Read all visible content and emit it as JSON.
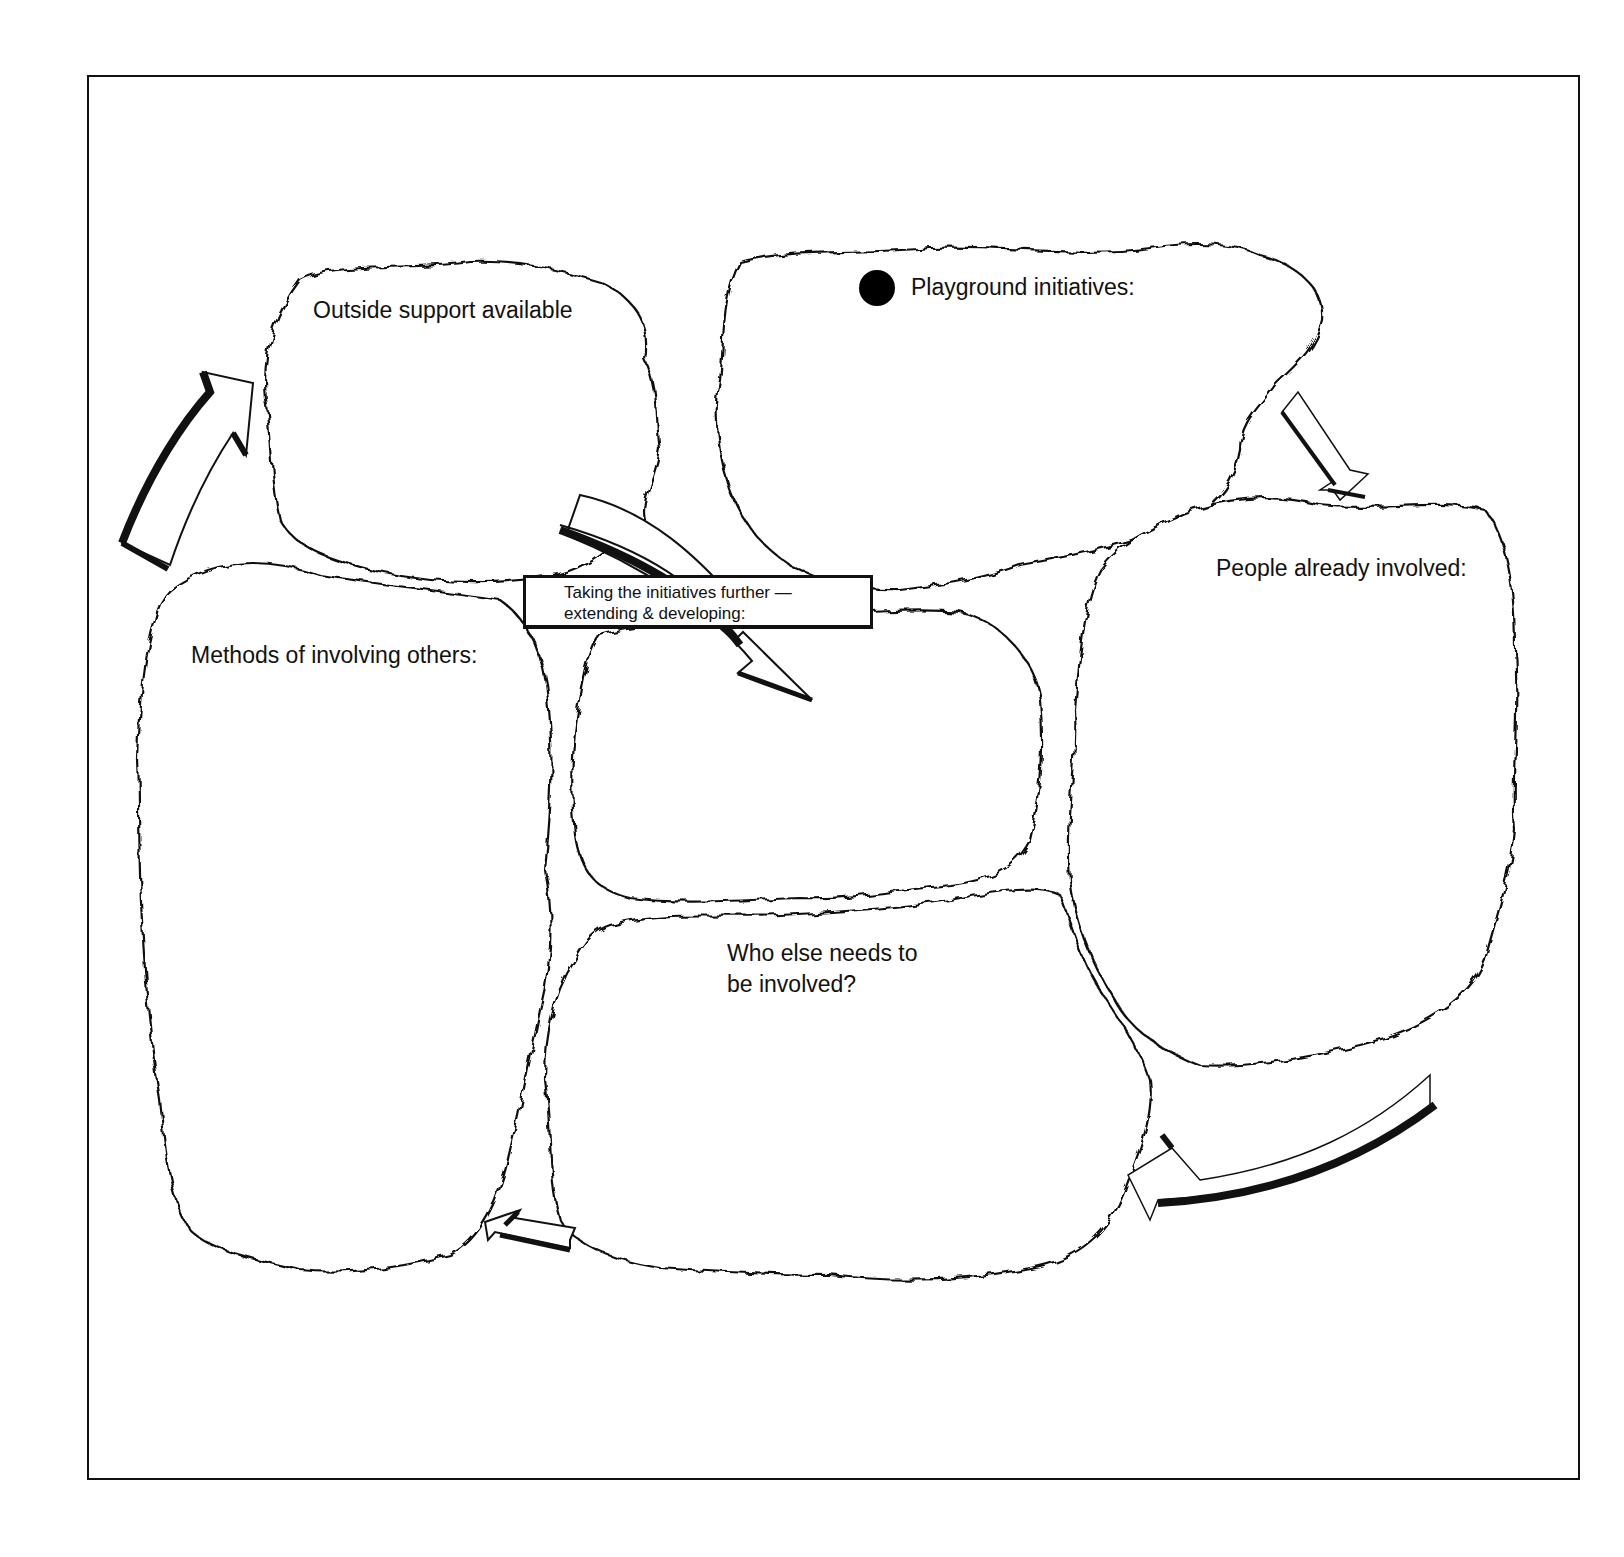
{
  "diagram": {
    "title_box": {
      "line1": "Taking the initiatives further —",
      "line2": "extending & developing:"
    },
    "clouds": [
      {
        "id": "playground-initiatives",
        "label": "Playground initiatives:",
        "bullet": "filled-circle"
      },
      {
        "id": "people-already-involved",
        "label": "People already involved:"
      },
      {
        "id": "who-else-needs",
        "line1": "Who else needs to",
        "line2": "be involved?"
      },
      {
        "id": "methods-of-involving",
        "label": "Methods of involving others:"
      },
      {
        "id": "outside-support",
        "label": "Outside support available"
      },
      {
        "id": "taking-further",
        "label": ""
      }
    ],
    "arrows": [
      {
        "from": "playground-initiatives",
        "to": "people-already-involved"
      },
      {
        "from": "people-already-involved",
        "to": "who-else-needs"
      },
      {
        "from": "who-else-needs",
        "to": "methods-of-involving"
      },
      {
        "from": "methods-of-involving",
        "to": "outside-support"
      },
      {
        "from": "outside-support",
        "to": "taking-further"
      }
    ]
  }
}
